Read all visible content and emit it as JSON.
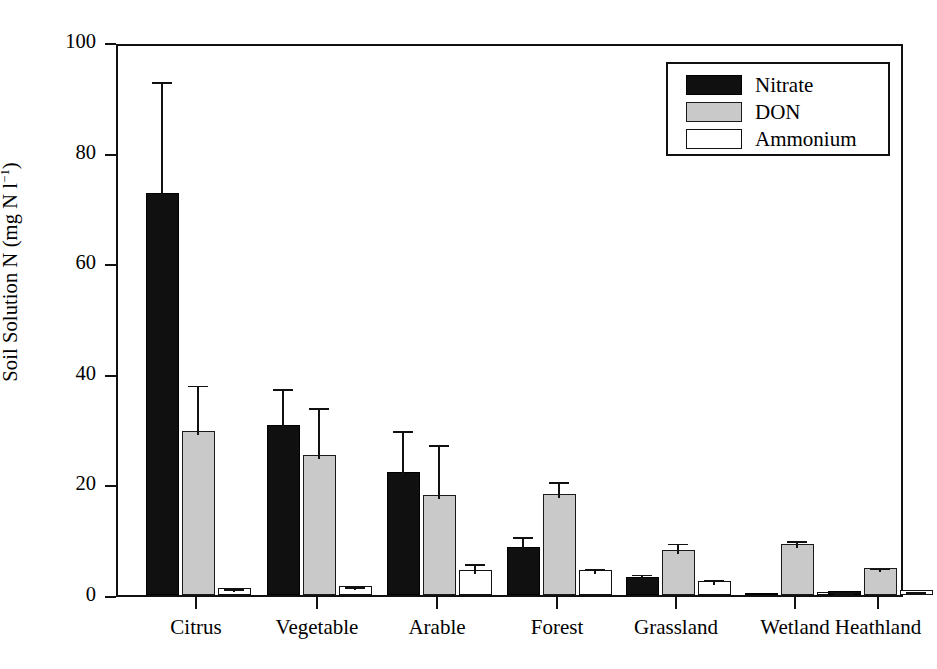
{
  "chart_data": {
    "type": "bar",
    "title": "",
    "xlabel": "",
    "ylabel": "Soil Solution N (mg N l⁻¹)",
    "ylim": [
      0,
      100
    ],
    "yticks": [
      0,
      20,
      40,
      60,
      80,
      100
    ],
    "grid": false,
    "legend_position": "top-right",
    "categories": [
      "Citrus",
      "Vegetable",
      "Arable",
      "Forest",
      "Grassland",
      "Wetland",
      "Heathland"
    ],
    "series": [
      {
        "name": "Nitrate",
        "color": "#101010",
        "values": [
          72.7,
          30.8,
          22.2,
          8.7,
          3.3,
          0.4,
          0.7
        ],
        "errors": [
          20.8,
          7.1,
          8.1,
          2.5,
          1.1,
          0.3,
          0.4
        ]
      },
      {
        "name": "DON",
        "color": "#c9c9c9",
        "values": [
          29.6,
          25.3,
          18.0,
          18.3,
          8.2,
          9.3,
          4.9
        ],
        "errors": [
          9.0,
          9.2,
          9.9,
          2.8,
          1.8,
          1.1,
          0.6
        ]
      },
      {
        "name": "Ammonium",
        "color": "#ffffff",
        "values": [
          1.3,
          1.6,
          4.6,
          4.5,
          2.6,
          0.6,
          0.9
        ],
        "errors": [
          0.5,
          0.5,
          1.7,
          0.9,
          0.9,
          0.3,
          0.4
        ]
      }
    ]
  },
  "axes": {
    "y_label_prefix": "Soil Solution N (mg N l",
    "y_label_exponent": "−1",
    "y_label_suffix": ")",
    "ytick_labels": [
      "100",
      "80",
      "60",
      "40",
      "20",
      "0"
    ],
    "xtick_labels": [
      "Citrus",
      "Vegetable",
      "Arable",
      "Forest",
      "Grassland",
      "Wetland",
      "Heathland"
    ]
  },
  "legend": {
    "items": [
      {
        "label": "Nitrate",
        "swatch": "nitrate"
      },
      {
        "label": "DON",
        "swatch": "don"
      },
      {
        "label": "Ammonium",
        "swatch": "ammonium"
      }
    ]
  }
}
